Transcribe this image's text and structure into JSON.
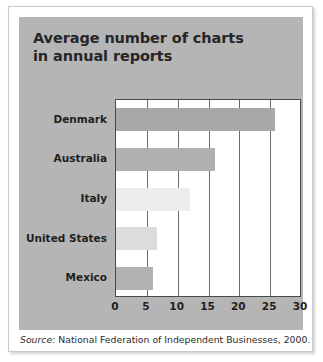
{
  "figure": {
    "title_line1": "Average number of charts",
    "title_line2": "in annual reports",
    "source_label": "Source:",
    "source_text": "National Federation of Independent Businesses, 2000.",
    "panel_color": "#b5b5b5",
    "plot_background": "#ffffff",
    "axis_color": "#4a4a4a"
  },
  "chart_data": {
    "type": "bar",
    "orientation": "horizontal",
    "title": "Average number of charts in annual reports",
    "xlabel": "",
    "ylabel": "",
    "xlim": [
      0,
      30
    ],
    "xticks": [
      0,
      5,
      10,
      15,
      20,
      25,
      30
    ],
    "grid": true,
    "grid_axis": "x",
    "legend": "none",
    "categories": [
      "Denmark",
      "Australia",
      "Italy",
      "United States",
      "Mexico"
    ],
    "values": [
      25.8,
      16.0,
      12.0,
      6.6,
      6.0
    ],
    "bar_colors": [
      "#a8a8a8",
      "#b0b0b0",
      "#ececec",
      "#dcdcdc",
      "#b2b2b2"
    ],
    "source": "National Federation of Independent Businesses, 2000."
  }
}
